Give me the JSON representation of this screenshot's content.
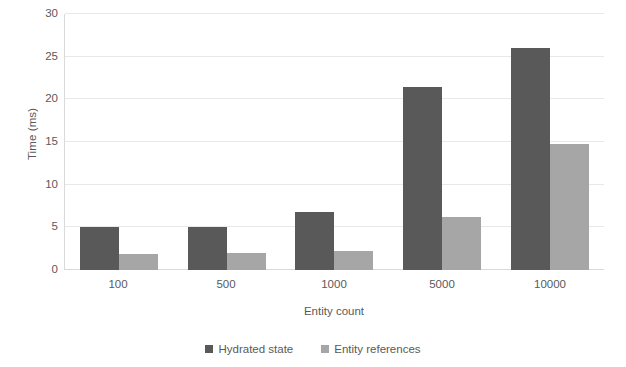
{
  "chart_data": {
    "type": "bar",
    "title": "",
    "xlabel": "Entity count",
    "ylabel": "Time (ms)",
    "categories": [
      "100",
      "500",
      "1000",
      "5000",
      "10000"
    ],
    "series": [
      {
        "name": "Hydrated state",
        "color": "#595959",
        "values": [
          5.0,
          5.0,
          6.8,
          21.4,
          26.0
        ]
      },
      {
        "name": "Entity references",
        "color": "#a6a6a6",
        "values": [
          1.9,
          2.0,
          2.2,
          6.2,
          14.8
        ]
      }
    ],
    "ylim": [
      0,
      30
    ],
    "yticks": [
      0,
      5,
      10,
      15,
      20,
      25,
      30
    ],
    "ytick_labels": [
      "0",
      "5",
      "10",
      "15",
      "20",
      "25",
      "30"
    ],
    "grid": true,
    "grid_axis": "y",
    "legend_position": "bottom",
    "bar_mode": "grouped"
  },
  "axes": {
    "y_title": "Time (ms)",
    "x_title": "Entity count"
  },
  "legend": {
    "items": [
      {
        "label": "Hydrated state",
        "color": "#595959"
      },
      {
        "label": "Entity references",
        "color": "#a6a6a6"
      }
    ]
  },
  "colors": {
    "series_dark": "#595959",
    "series_light": "#a6a6a6",
    "gridline": "#e8e8e8",
    "axis_line": "#d9d9d9",
    "text": "#5a5a5a",
    "background": "#ffffff"
  }
}
